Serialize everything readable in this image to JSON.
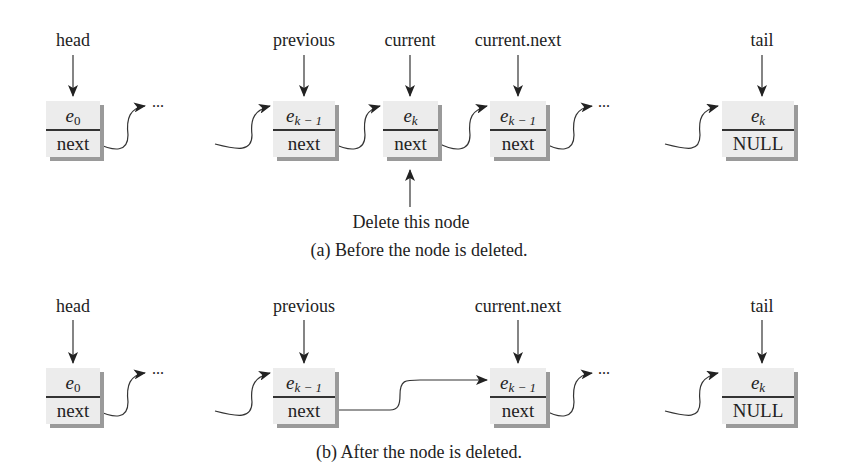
{
  "panel_a": {
    "caption": "(a) Before the node is deleted.",
    "annotation": "Delete this node",
    "pointers": {
      "head": "head",
      "previous": "previous",
      "current": "current",
      "current_next": "current.next",
      "tail": "tail"
    },
    "nodes": [
      {
        "id": "e0",
        "element": "e",
        "subscript": "0",
        "link": "next"
      },
      {
        "id": "previous",
        "element": "e",
        "subscript": "k",
        "subscript_suffix": " − 1",
        "link": "next"
      },
      {
        "id": "current",
        "element": "e",
        "subscript": "k",
        "subscript_suffix": "",
        "link": "next"
      },
      {
        "id": "current_next",
        "element": "e",
        "subscript": "k",
        "subscript_suffix": " − 1",
        "link": "next"
      },
      {
        "id": "tail",
        "element": "e",
        "subscript": "k",
        "subscript_suffix": "",
        "link": "NULL"
      }
    ],
    "ellipsis": "..."
  },
  "panel_b": {
    "caption": "(b) After the node is deleted.",
    "pointers": {
      "head": "head",
      "previous": "previous",
      "current_next": "current.next",
      "tail": "tail"
    },
    "nodes": [
      {
        "id": "e0",
        "element": "e",
        "subscript": "0",
        "link": "next"
      },
      {
        "id": "previous",
        "element": "e",
        "subscript": "k",
        "subscript_suffix": " − 1",
        "link": "next"
      },
      {
        "id": "current_next",
        "element": "e",
        "subscript": "k",
        "subscript_suffix": " − 1",
        "link": "next"
      },
      {
        "id": "tail",
        "element": "e",
        "subscript": "k",
        "subscript_suffix": "",
        "link": "NULL"
      }
    ],
    "ellipsis": "..."
  }
}
